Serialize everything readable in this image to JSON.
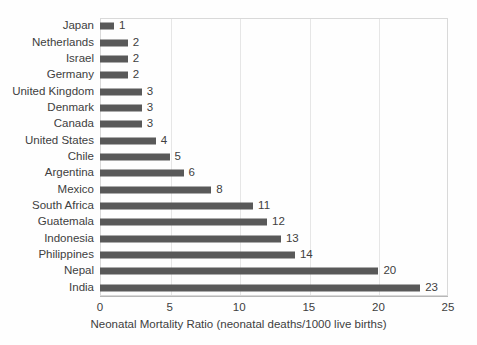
{
  "chart_data": {
    "type": "bar",
    "orientation": "horizontal",
    "title": "",
    "xlabel": "Neonatal Mortality Ratio (neonatal deaths/1000 live births)",
    "ylabel": "",
    "xlim": [
      0,
      25
    ],
    "xticks": [
      0,
      5,
      10,
      15,
      20,
      25
    ],
    "xtick_labels": [
      "0",
      "5",
      "10",
      "15",
      "20",
      "25"
    ],
    "grid": "vertical",
    "legend": "none",
    "data_labels": true,
    "bar_color": "#595959",
    "gridline_color": "#e6e6e6",
    "plot_border_color": "#d9d9d9",
    "text_color": "#404040",
    "categories": [
      "Japan",
      "Netherlands",
      "Israel",
      "Germany",
      "United Kingdom",
      "Denmark",
      "Canada",
      "United States",
      "Chile",
      "Argentina",
      "Mexico",
      "South Africa",
      "Guatemala",
      "Indonesia",
      "Philippines",
      "Nepal",
      "India"
    ],
    "values": [
      1,
      2,
      2,
      2,
      3,
      3,
      3,
      4,
      5,
      6,
      8,
      11,
      12,
      13,
      14,
      20,
      23
    ],
    "value_labels": [
      "1",
      "2",
      "2",
      "2",
      "3",
      "3",
      "3",
      "4",
      "5",
      "6",
      "8",
      "11",
      "12",
      "13",
      "14",
      "20",
      "23"
    ]
  }
}
